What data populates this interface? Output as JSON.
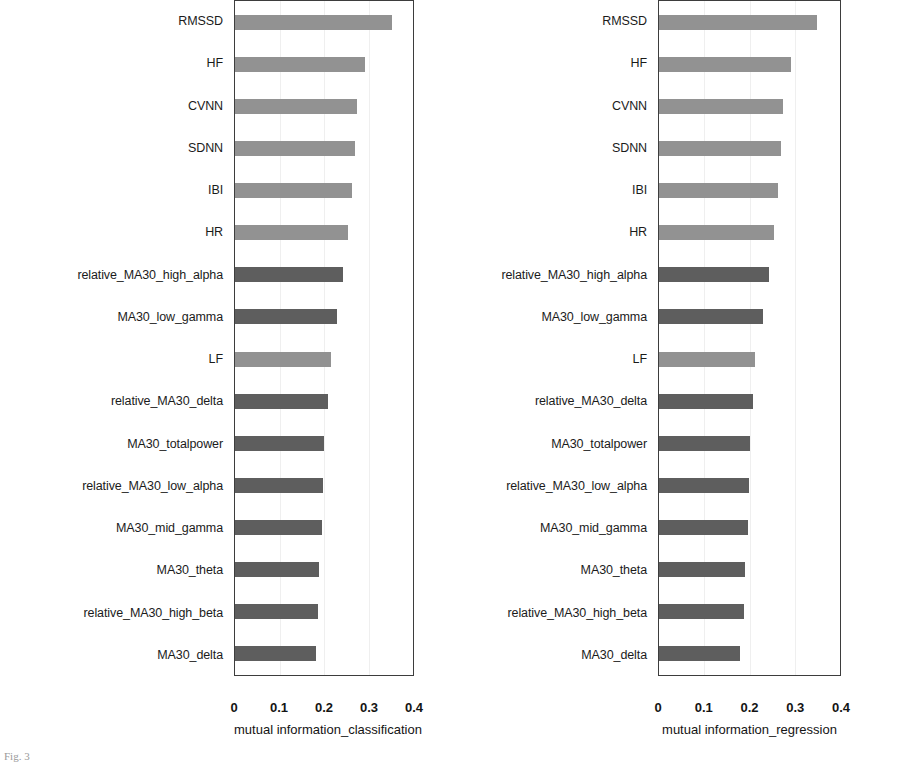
{
  "figure": {
    "caption_fragment": "Fig. 3"
  },
  "chart_data": [
    {
      "type": "bar",
      "orientation": "horizontal",
      "title": "",
      "xlabel": "mutual information_classification",
      "ylabel": "",
      "xlim": [
        0,
        0.4
      ],
      "xticks": [
        "0",
        "0.1",
        "0.2",
        "0.3",
        "0.4"
      ],
      "xtick_values": [
        0,
        0.1,
        0.2,
        0.3,
        0.4
      ],
      "grid": true,
      "grid_axis": "x",
      "legend": "none",
      "bar_color": "#7a7a7a",
      "categories": [
        "RMSSD",
        "HF",
        "CVNN",
        "SDNN",
        "IBI",
        "HR",
        "relative_MA30_high_alpha",
        "MA30_low_gamma",
        "LF",
        "relative_MA30_delta",
        "MA30_totalpower",
        "relative_MA30_low_alpha",
        "MA30_mid_gamma",
        "MA30_theta",
        "relative_MA30_high_beta",
        "MA30_delta"
      ],
      "values": [
        0.353,
        0.293,
        0.274,
        0.269,
        0.263,
        0.254,
        0.243,
        0.229,
        0.215,
        0.208,
        0.201,
        0.197,
        0.196,
        0.188,
        0.186,
        0.181
      ],
      "shades": [
        "light",
        "light",
        "light",
        "light",
        "light",
        "light",
        "dark",
        "dark",
        "light",
        "dark",
        "dark",
        "dark",
        "dark",
        "dark",
        "dark",
        "dark"
      ]
    },
    {
      "type": "bar",
      "orientation": "horizontal",
      "title": "",
      "xlabel": "mutual information_regression",
      "ylabel": "",
      "xlim": [
        0,
        0.4
      ],
      "xticks": [
        "0",
        "0.1",
        "0.2",
        "0.3",
        "0.4"
      ],
      "xtick_values": [
        0,
        0.1,
        0.2,
        0.3,
        0.4
      ],
      "grid": true,
      "grid_axis": "x",
      "legend": "none",
      "bar_color": "#7a7a7a",
      "categories": [
        "RMSSD",
        "HF",
        "CVNN",
        "SDNN",
        "IBI",
        "HR",
        "relative_MA30_high_alpha",
        "MA30_low_gamma",
        "LF",
        "relative_MA30_delta",
        "MA30_totalpower",
        "relative_MA30_low_alpha",
        "MA30_mid_gamma",
        "MA30_theta",
        "relative_MA30_high_beta",
        "MA30_delta"
      ],
      "values": [
        0.35,
        0.292,
        0.273,
        0.27,
        0.264,
        0.254,
        0.243,
        0.23,
        0.213,
        0.207,
        0.201,
        0.199,
        0.197,
        0.19,
        0.188,
        0.18
      ],
      "shades": [
        "light",
        "light",
        "light",
        "light",
        "light",
        "light",
        "dark",
        "dark",
        "light",
        "dark",
        "dark",
        "dark",
        "dark",
        "dark",
        "dark",
        "dark"
      ]
    }
  ]
}
